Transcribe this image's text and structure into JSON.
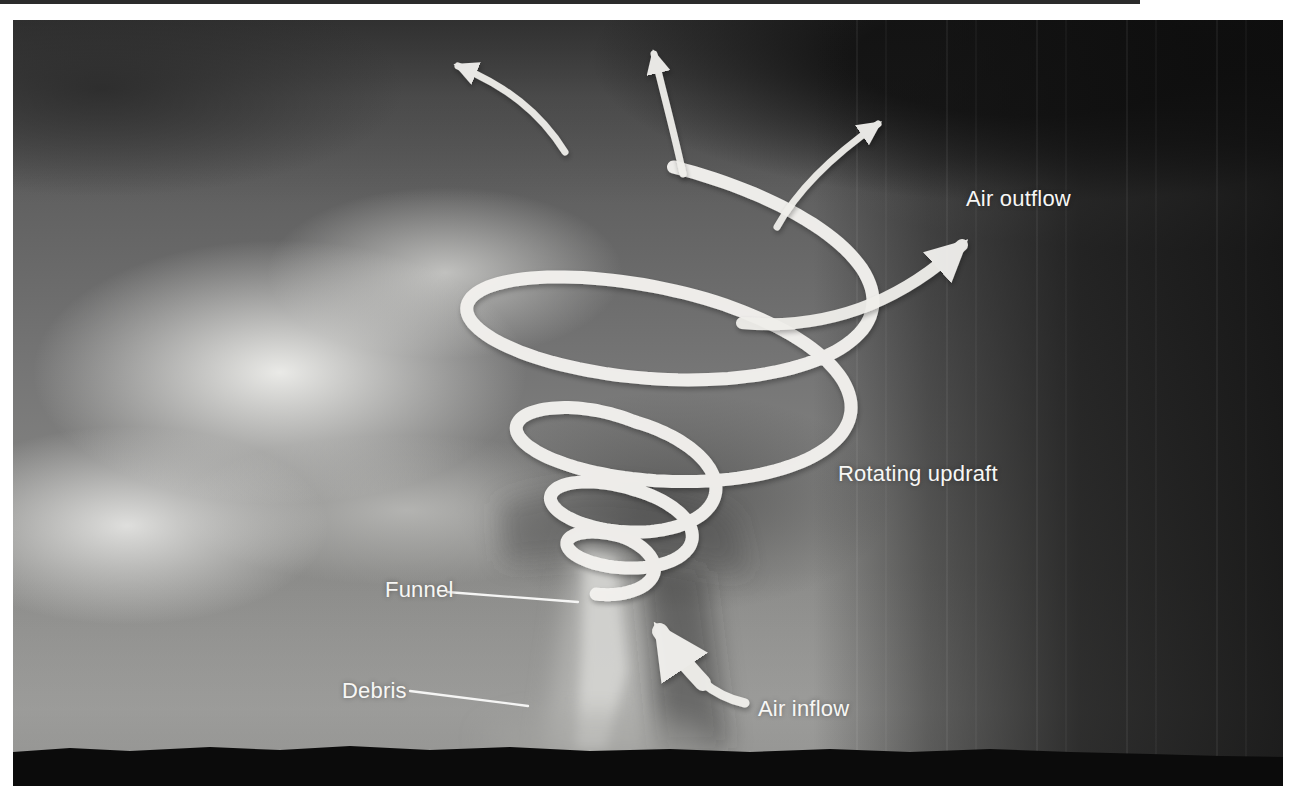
{
  "labels": {
    "air_outflow": "Air outflow",
    "rotating_updraft": "Rotating updraft",
    "funnel": "Funnel",
    "debris": "Debris",
    "air_inflow": "Air inflow"
  },
  "colors": {
    "page_background": "#ffffff",
    "top_strip": "#2b2b2b",
    "overlay_white": "#f2f1ee",
    "annotation_text": "#f7f7f5",
    "ground_silhouette": "#0b0b0b"
  },
  "spiral": {
    "tilt": 0.16,
    "keyframes": [
      [
        0.0,
        662,
        238,
        208,
        72
      ],
      [
        1.0,
        680,
        372,
        212,
        78
      ],
      [
        2.0,
        627,
        466,
        95,
        45
      ],
      [
        3.0,
        628,
        521,
        72,
        32
      ],
      [
        4.0,
        620,
        560,
        50,
        23
      ],
      [
        4.55,
        606,
        584,
        26,
        12
      ]
    ]
  }
}
